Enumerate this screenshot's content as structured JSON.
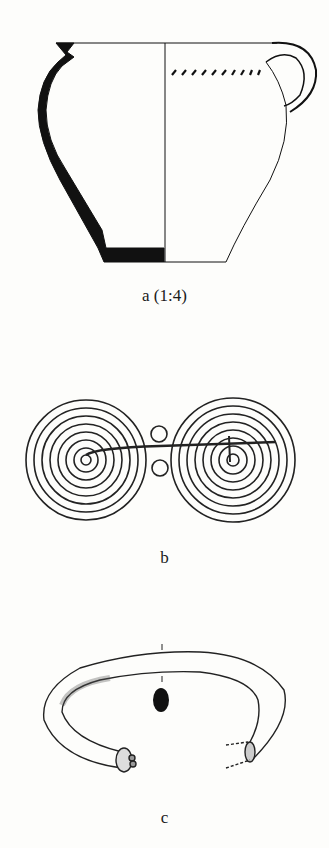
{
  "figures": {
    "a": {
      "label": "a (1:4)",
      "description": "pottery jug section drawing"
    },
    "b": {
      "label": "b",
      "description": "double spiral fibula"
    },
    "c": {
      "label": "c",
      "description": "bracelet with knobbed terminal"
    }
  },
  "colors": {
    "ink": "#111111",
    "paper": "#fdfdfb"
  }
}
